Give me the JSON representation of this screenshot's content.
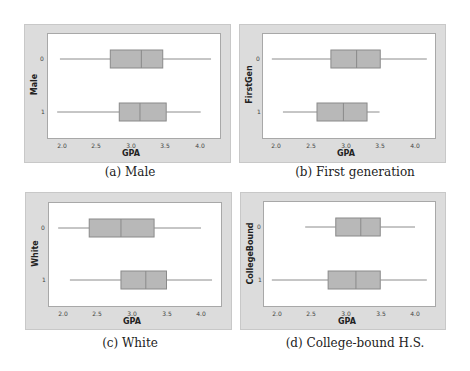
{
  "chart_data": [
    {
      "type": "boxplot",
      "orientation": "horizontal",
      "caption": "(a) Male",
      "ylabel": "Male",
      "xlabel": "GPA",
      "xticks": [
        "2.0",
        "2.5",
        "3.0",
        "3.5",
        "4.0"
      ],
      "xlim": [
        1.8,
        4.25
      ],
      "categories": [
        "0",
        "1"
      ],
      "series": [
        {
          "name": "0",
          "whisker_low": 1.97,
          "q1": 2.7,
          "median": 3.15,
          "q3": 3.46,
          "whisker_high": 4.16
        },
        {
          "name": "1",
          "whisker_low": 1.93,
          "q1": 2.83,
          "median": 3.13,
          "q3": 3.51,
          "whisker_high": 4.01
        }
      ]
    },
    {
      "type": "boxplot",
      "orientation": "horizontal",
      "caption": "(b) First generation",
      "ylabel": "FirstGen",
      "xlabel": "GPA",
      "xticks": [
        "2.0",
        "2.5",
        "3.0",
        "3.5",
        "4.0"
      ],
      "xlim": [
        1.8,
        4.25
      ],
      "categories": [
        "0",
        "1"
      ],
      "series": [
        {
          "name": "0",
          "whisker_low": 1.94,
          "q1": 2.79,
          "median": 3.16,
          "q3": 3.5,
          "whisker_high": 4.17
        },
        {
          "name": "1",
          "whisker_low": 2.1,
          "q1": 2.59,
          "median": 2.97,
          "q3": 3.31,
          "whisker_high": 3.49
        }
      ]
    },
    {
      "type": "boxplot",
      "orientation": "horizontal",
      "caption": "(c) White",
      "ylabel": "White",
      "xlabel": "GPA",
      "xticks": [
        "2.0",
        "2.5",
        "3.0",
        "3.5",
        "4.0"
      ],
      "xlim": [
        1.8,
        4.25
      ],
      "categories": [
        "0",
        "1"
      ],
      "series": [
        {
          "name": "0",
          "whisker_low": 1.93,
          "q1": 2.38,
          "median": 2.84,
          "q3": 3.32,
          "whisker_high": 4.0
        },
        {
          "name": "1",
          "whisker_low": 2.1,
          "q1": 2.84,
          "median": 3.2,
          "q3": 3.5,
          "whisker_high": 4.16
        }
      ]
    },
    {
      "type": "boxplot",
      "orientation": "horizontal",
      "caption": "(d) College-bound H.S.",
      "ylabel": "CollegeBound",
      "xlabel": "GPA",
      "xticks": [
        "2.0",
        "2.5",
        "3.0",
        "3.5",
        "4.0"
      ],
      "xlim": [
        1.8,
        4.25
      ],
      "categories": [
        "0",
        "1"
      ],
      "series": [
        {
          "name": "0",
          "whisker_low": 2.42,
          "q1": 2.86,
          "median": 3.22,
          "q3": 3.5,
          "whisker_high": 4.0
        },
        {
          "name": "1",
          "whisker_low": 1.94,
          "q1": 2.75,
          "median": 3.15,
          "q3": 3.5,
          "whisker_high": 4.17
        }
      ]
    }
  ],
  "colors": {
    "frame": "#dcdcdc",
    "box_fill": "#b8b8b8",
    "box_stroke": "#8a8a8a",
    "whisker": "#8c8c8c"
  }
}
